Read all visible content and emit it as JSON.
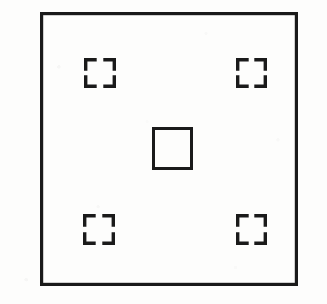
{
  "figure": {
    "canvas": {
      "width": 327,
      "height": 304
    },
    "background_color": "#fdfdfc",
    "ink_color": "#1a1a1a",
    "outer_frame": {
      "label": "outer-frame",
      "x": 40,
      "y": 12,
      "width": 258,
      "height": 274,
      "stroke_width": 3.2
    },
    "center_square": {
      "label": "center-square",
      "x": 152,
      "y": 127,
      "width": 41,
      "height": 43,
      "stroke_width": 3.0
    },
    "bracket_geometry": {
      "arm_length": 11,
      "stroke_width": 3.4,
      "note": "each bracket is four L-shaped corner marks forming a broken square"
    },
    "brackets": [
      {
        "label": "bracket-top-left",
        "position": "top-left",
        "x": 84,
        "y": 58,
        "width": 32,
        "height": 30
      },
      {
        "label": "bracket-top-right",
        "position": "top-right",
        "x": 236,
        "y": 58,
        "width": 31,
        "height": 30
      },
      {
        "label": "bracket-bottom-left",
        "position": "bottom-left",
        "x": 83,
        "y": 214,
        "width": 32,
        "height": 31
      },
      {
        "label": "bracket-bottom-right",
        "position": "bottom-right",
        "x": 236,
        "y": 214,
        "width": 31,
        "height": 31
      }
    ]
  }
}
